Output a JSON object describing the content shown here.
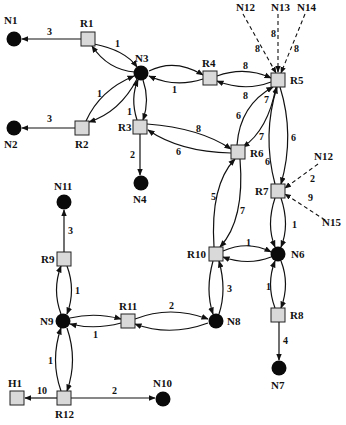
{
  "diagram": {
    "type": "network-topology",
    "nodes": {
      "N1": {
        "label": "N1",
        "kind": "network",
        "x": 14,
        "y": 39
      },
      "N2": {
        "label": "N2",
        "kind": "network",
        "x": 14,
        "y": 128
      },
      "N3": {
        "label": "N3",
        "kind": "network",
        "x": 141,
        "y": 73
      },
      "N4": {
        "label": "N4",
        "kind": "network",
        "x": 141,
        "y": 183
      },
      "N6": {
        "label": "N6",
        "kind": "network",
        "x": 278,
        "y": 254
      },
      "N7": {
        "label": "N7",
        "kind": "network",
        "x": 279,
        "y": 368
      },
      "N8": {
        "label": "N8",
        "kind": "network",
        "x": 216,
        "y": 321
      },
      "N9": {
        "label": "N9",
        "kind": "network",
        "x": 63,
        "y": 321
      },
      "N10": {
        "label": "N10",
        "kind": "network",
        "x": 163,
        "y": 399
      },
      "N11": {
        "label": "N11",
        "kind": "network",
        "x": 64,
        "y": 202
      },
      "R1": {
        "label": "R1",
        "kind": "router",
        "x": 88,
        "y": 39
      },
      "R2": {
        "label": "R2",
        "kind": "router",
        "x": 82,
        "y": 128
      },
      "R3": {
        "label": "R3",
        "kind": "router",
        "x": 140,
        "y": 127
      },
      "R4": {
        "label": "R4",
        "kind": "router",
        "x": 210,
        "y": 78
      },
      "R5": {
        "label": "R5",
        "kind": "router",
        "x": 278,
        "y": 80
      },
      "R6": {
        "label": "R6",
        "kind": "router",
        "x": 238,
        "y": 152
      },
      "R7": {
        "label": "R7",
        "kind": "router",
        "x": 278,
        "y": 191
      },
      "R8": {
        "label": "R8",
        "kind": "router",
        "x": 278,
        "y": 315
      },
      "R9": {
        "label": "R9",
        "kind": "router",
        "x": 64,
        "y": 259
      },
      "R10": {
        "label": "R10",
        "kind": "router",
        "x": 216,
        "y": 254
      },
      "R11": {
        "label": "R11",
        "kind": "router",
        "x": 128,
        "y": 321
      },
      "R12": {
        "label": "R12",
        "kind": "router",
        "x": 64,
        "y": 398
      },
      "H1": {
        "label": "H1",
        "kind": "host",
        "x": 17,
        "y": 398
      }
    },
    "external_labels": {
      "N12_top": "N12",
      "N13": "N13",
      "N14": "N14",
      "N12_right": "N12",
      "N15": "N15"
    },
    "edges": [
      {
        "from": "R1",
        "to": "N1",
        "cost": "3"
      },
      {
        "from": "R1",
        "to": "N3",
        "cost": "1"
      },
      {
        "from": "N3",
        "to": "R1",
        "cost": ""
      },
      {
        "from": "R2",
        "to": "N2",
        "cost": "3"
      },
      {
        "from": "R2",
        "to": "N3",
        "cost": "1"
      },
      {
        "from": "N3",
        "to": "R2",
        "cost": ""
      },
      {
        "from": "R3",
        "to": "N3",
        "cost": "1"
      },
      {
        "from": "N3",
        "to": "R3",
        "cost": ""
      },
      {
        "from": "R4",
        "to": "N3",
        "cost": "1"
      },
      {
        "from": "N3",
        "to": "R4",
        "cost": ""
      },
      {
        "from": "R3",
        "to": "N4",
        "cost": "2"
      },
      {
        "from": "R3",
        "to": "R6",
        "cost": "8"
      },
      {
        "from": "R6",
        "to": "R3",
        "cost": "6"
      },
      {
        "from": "R4",
        "to": "R5",
        "cost": "8"
      },
      {
        "from": "R5",
        "to": "R4",
        "cost": "8"
      },
      {
        "from": "R5",
        "to": "R6",
        "cost": "7"
      },
      {
        "from": "R6",
        "to": "R5",
        "cost": "6"
      },
      {
        "from": "R5",
        "to": "R7",
        "cost": "6"
      },
      {
        "from": "R7",
        "to": "R5",
        "cost": "6"
      },
      {
        "from": "R6",
        "to": "R10",
        "cost": "7"
      },
      {
        "from": "R10",
        "to": "R6",
        "cost": "5"
      },
      {
        "from": "R7",
        "to": "N6",
        "cost": "1"
      },
      {
        "from": "N6",
        "to": "R7",
        "cost": ""
      },
      {
        "from": "R10",
        "to": "N6",
        "cost": "1"
      },
      {
        "from": "N6",
        "to": "R10",
        "cost": ""
      },
      {
        "from": "R8",
        "to": "N6",
        "cost": "1"
      },
      {
        "from": "N6",
        "to": "R8",
        "cost": ""
      },
      {
        "from": "R8",
        "to": "N7",
        "cost": "4"
      },
      {
        "from": "R10",
        "to": "N8",
        "cost": "3"
      },
      {
        "from": "N8",
        "to": "R10",
        "cost": ""
      },
      {
        "from": "R11",
        "to": "N8",
        "cost": "2"
      },
      {
        "from": "N8",
        "to": "R11",
        "cost": ""
      },
      {
        "from": "R11",
        "to": "N9",
        "cost": "1"
      },
      {
        "from": "N9",
        "to": "R11",
        "cost": ""
      },
      {
        "from": "R9",
        "to": "N9",
        "cost": "1"
      },
      {
        "from": "N9",
        "to": "R9",
        "cost": ""
      },
      {
        "from": "R9",
        "to": "N11",
        "cost": "3"
      },
      {
        "from": "R12",
        "to": "N9",
        "cost": "1"
      },
      {
        "from": "N9",
        "to": "R12",
        "cost": ""
      },
      {
        "from": "R12",
        "to": "H1",
        "cost": "10"
      },
      {
        "from": "R12",
        "to": "N10",
        "cost": "2"
      }
    ],
    "external_edges": [
      {
        "from": "N12",
        "to": "R5",
        "cost": "8",
        "style": "dashed"
      },
      {
        "from": "N13",
        "to": "R5",
        "cost": "8",
        "style": "dashed"
      },
      {
        "from": "N14",
        "to": "R5",
        "cost": "8",
        "style": "dashed"
      },
      {
        "from": "N12",
        "to": "R7",
        "cost": "2",
        "style": "dashed"
      },
      {
        "from": "N15",
        "to": "R7",
        "cost": "9",
        "style": "dashed"
      }
    ],
    "weights": {
      "r1_n1": "3",
      "r1_n3": "1",
      "r2_n2": "3",
      "r2_n3": "1",
      "r3_n3": "1",
      "r4_n3": "1",
      "r3_n4": "2",
      "r3_r6": "8",
      "r6_r3": "6",
      "r4_r5": "8",
      "r5_r4": "8",
      "r5_r6": "7",
      "r6_r5_top": "7",
      "r6_r5": "6",
      "r5_r7": "6",
      "r7_r5": "6",
      "r6_r10": "7",
      "r10_r6": "5",
      "r7_n6": "1",
      "r10_n6": "1",
      "r8_n6": "1",
      "r8_n7": "4",
      "r10_n8": "3",
      "r11_n8": "2",
      "r11_n9": "1",
      "r9_n9": "1",
      "r9_n11": "3",
      "r12_n9": "1",
      "r12_h1": "10",
      "r12_n10": "2",
      "n12_r5": "8",
      "n13_r5": "8",
      "n14_r5": "8",
      "n12_r7": "2",
      "n15_r7": "9"
    }
  }
}
